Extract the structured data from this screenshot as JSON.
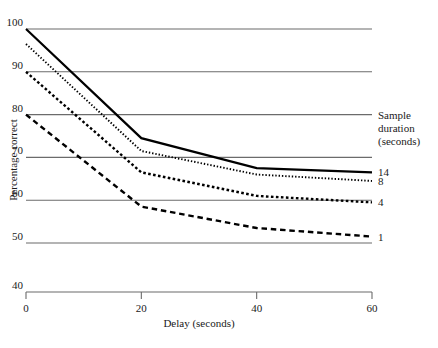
{
  "chart_data": {
    "type": "line",
    "title": "",
    "xlabel": "Delay (seconds)",
    "ylabel": "Percentage correct",
    "x": [
      0,
      20,
      40,
      60
    ],
    "xticks": [
      "0",
      "20",
      "40",
      "60"
    ],
    "yticks": [
      "100",
      "90",
      "80",
      "70",
      "60",
      "50",
      "40"
    ],
    "xlim": [
      0,
      60
    ],
    "ylim": [
      40,
      100
    ],
    "grid": "horizontal",
    "axis_break": "y-axis baseline drawn at 40 with gap below 50",
    "legend_position": "right",
    "legend_title_line1": "Sample",
    "legend_title_line2": "duration",
    "legend_title_line3": "(seconds)",
    "series": [
      {
        "name": "14",
        "label": "14",
        "style": "solid",
        "values": [
          100.0,
          74.5,
          67.5,
          66.5
        ]
      },
      {
        "name": "8",
        "label": "8",
        "style": "fine-dotted",
        "values": [
          96.5,
          71.5,
          66.0,
          64.5
        ]
      },
      {
        "name": "4",
        "label": "4",
        "style": "square-dotted",
        "values": [
          90.0,
          66.5,
          61.0,
          59.5
        ]
      },
      {
        "name": "1",
        "label": "1",
        "style": "dashed",
        "values": [
          80.0,
          58.5,
          53.5,
          51.5
        ]
      }
    ]
  },
  "colors": {
    "line": "#000000",
    "grid": "#6b6b6b",
    "axis": "#6b6b6b",
    "text": "#1a1a1a",
    "background": "#ffffff"
  }
}
